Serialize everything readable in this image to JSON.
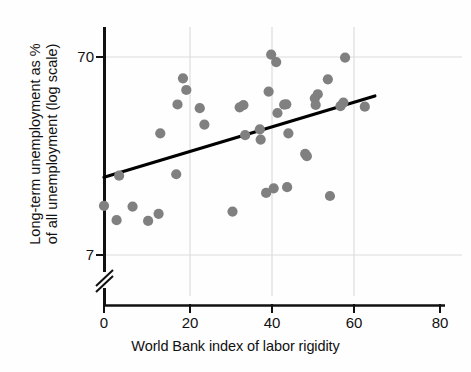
{
  "chart_data": {
    "type": "scatter",
    "title": "",
    "xlabel": "World Bank index of labor rigidity",
    "ylabel_line1": "Long-term unemployment as %",
    "ylabel_line2": "of all unemployment (log scale)",
    "ylabel": "Long-term unemployment as % of all unemployment (log scale)",
    "x_ticks": [
      0,
      20,
      40,
      60,
      80
    ],
    "x_tick_labels": [
      "0",
      "20",
      "40",
      "60",
      "80"
    ],
    "xlim": [
      0,
      80
    ],
    "y_ticks": [
      7,
      70
    ],
    "y_tick_labels": [
      "7",
      "70"
    ],
    "y_scale": "log",
    "ylim": [
      7,
      70
    ],
    "axis_break": true,
    "grid": true,
    "grid_color": "#d9d9d9",
    "legend": null,
    "marker_color": "#808080",
    "line_color": "#000000",
    "points": [
      {
        "x": 0.0,
        "y": 12.4
      },
      {
        "x": 3.0,
        "y": 10.5
      },
      {
        "x": 3.6,
        "y": 17.6
      },
      {
        "x": 6.8,
        "y": 12.3
      },
      {
        "x": 10.5,
        "y": 10.4
      },
      {
        "x": 13.0,
        "y": 11.3
      },
      {
        "x": 13.4,
        "y": 28.8
      },
      {
        "x": 17.2,
        "y": 17.9
      },
      {
        "x": 17.5,
        "y": 40.3
      },
      {
        "x": 18.8,
        "y": 54.6
      },
      {
        "x": 19.6,
        "y": 47.7
      },
      {
        "x": 22.8,
        "y": 38.6
      },
      {
        "x": 23.9,
        "y": 31.9
      },
      {
        "x": 30.6,
        "y": 11.6
      },
      {
        "x": 32.3,
        "y": 39.0
      },
      {
        "x": 33.2,
        "y": 40.0
      },
      {
        "x": 33.6,
        "y": 28.2
      },
      {
        "x": 37.1,
        "y": 30.2
      },
      {
        "x": 37.3,
        "y": 26.8
      },
      {
        "x": 38.6,
        "y": 14.4
      },
      {
        "x": 39.2,
        "y": 46.8
      },
      {
        "x": 39.8,
        "y": 72.0
      },
      {
        "x": 40.4,
        "y": 15.2
      },
      {
        "x": 41.0,
        "y": 66.0
      },
      {
        "x": 41.3,
        "y": 36.5
      },
      {
        "x": 42.9,
        "y": 40.2
      },
      {
        "x": 43.4,
        "y": 40.4
      },
      {
        "x": 43.6,
        "y": 15.4
      },
      {
        "x": 43.9,
        "y": 28.8
      },
      {
        "x": 47.9,
        "y": 22.7
      },
      {
        "x": 48.3,
        "y": 22.1
      },
      {
        "x": 50.2,
        "y": 43.3
      },
      {
        "x": 50.4,
        "y": 40.1
      },
      {
        "x": 50.9,
        "y": 45.4
      },
      {
        "x": 53.3,
        "y": 54.0
      },
      {
        "x": 53.8,
        "y": 13.9
      },
      {
        "x": 56.3,
        "y": 39.5
      },
      {
        "x": 57.0,
        "y": 41.2
      },
      {
        "x": 57.4,
        "y": 69.5
      },
      {
        "x": 62.1,
        "y": 39.3
      }
    ],
    "trend_line": {
      "x_start": 0.0,
      "y_start": 17.3,
      "x_end": 64.5,
      "y_end": 44.5,
      "type": "linear-fit"
    }
  }
}
